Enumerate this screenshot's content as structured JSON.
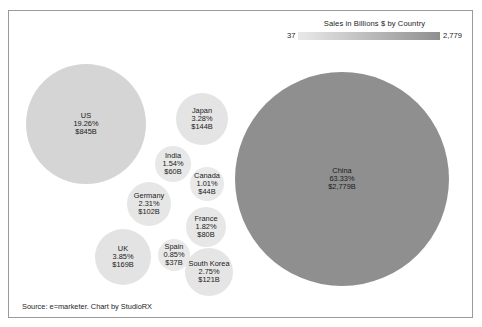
{
  "legend": {
    "title": "Sales in Billions $ by Country",
    "min_label": "37",
    "max_label": "2,779",
    "gradient_start": "#e9e9e9",
    "gradient_end": "#8f8f8f"
  },
  "footer": {
    "source": "Source: e=marketer. Chart by StudioRX"
  },
  "chart_data": {
    "type": "bubble",
    "title": "Sales in Billions $ by Country",
    "xlabel": "",
    "ylabel": "",
    "value_unit": "Billions $",
    "legend_position": "top-right",
    "grid": false,
    "color_scale": {
      "min": 37,
      "max": 2779,
      "min_color": "#e9e9e9",
      "max_color": "#8f8f8f"
    },
    "categories": [
      "China",
      "US",
      "UK",
      "Japan",
      "South Korea",
      "Germany",
      "France",
      "India",
      "Canada",
      "Spain"
    ],
    "values": [
      2779,
      845,
      169,
      144,
      121,
      102,
      80,
      60,
      44,
      37
    ],
    "percents": [
      63.33,
      19.26,
      3.85,
      3.28,
      2.75,
      2.31,
      1.82,
      1.54,
      1.01,
      0.85
    ],
    "series": [
      {
        "name": "Sales in Billions $ by Country",
        "points": [
          {
            "name": "China",
            "value": 2779,
            "percent": 63.33,
            "label_name": "China",
            "label_percent": "63.33%",
            "label_value": "$2,779B",
            "cx": 341,
            "cy": 178,
            "r": 107,
            "fill": "#8f8f8f"
          },
          {
            "name": "US",
            "value": 845,
            "percent": 19.26,
            "label_name": "US",
            "label_percent": "19.26%",
            "label_value": "$845B",
            "cx": 85,
            "cy": 123,
            "r": 60,
            "fill": "#d5d5d5"
          },
          {
            "name": "UK",
            "value": 169,
            "percent": 3.85,
            "label_name": "UK",
            "label_percent": "3.85%",
            "label_value": "$169B",
            "cx": 122,
            "cy": 256,
            "r": 28,
            "fill": "#e3e3e3"
          },
          {
            "name": "Japan",
            "value": 144,
            "percent": 3.28,
            "label_name": "Japan",
            "label_percent": "3.28%",
            "label_value": "$144B",
            "cx": 201,
            "cy": 118,
            "r": 26,
            "fill": "#e4e4e4"
          },
          {
            "name": "South Korea",
            "value": 121,
            "percent": 2.75,
            "label_name": "South Korea",
            "label_percent": "2.75%",
            "label_value": "$121B",
            "cx": 208,
            "cy": 271,
            "r": 24,
            "fill": "#e5e5e5"
          },
          {
            "name": "Germany",
            "value": 102,
            "percent": 2.31,
            "label_name": "Germany",
            "label_percent": "2.31%",
            "label_value": "$102B",
            "cx": 148,
            "cy": 203,
            "r": 22,
            "fill": "#e6e6e6"
          },
          {
            "name": "France",
            "value": 80,
            "percent": 1.82,
            "label_name": "France",
            "label_percent": "1.82%",
            "label_value": "$80B",
            "cx": 205,
            "cy": 226,
            "r": 20,
            "fill": "#e7e7e7"
          },
          {
            "name": "India",
            "value": 60,
            "percent": 1.54,
            "label_name": "India",
            "label_percent": "1.54%",
            "label_value": "$60B",
            "cx": 172,
            "cy": 163,
            "r": 18,
            "fill": "#e8e8e8"
          },
          {
            "name": "Canada",
            "value": 44,
            "percent": 1.01,
            "label_name": "Canada",
            "label_percent": "1.01%",
            "label_value": "$44B",
            "cx": 206,
            "cy": 183,
            "r": 17,
            "fill": "#e9e9e9"
          },
          {
            "name": "Spain",
            "value": 37,
            "percent": 0.85,
            "label_name": "Spain",
            "label_percent": "0.85%",
            "label_value": "$37B",
            "cx": 173,
            "cy": 254,
            "r": 16,
            "fill": "#e9e9e9"
          }
        ]
      }
    ]
  }
}
